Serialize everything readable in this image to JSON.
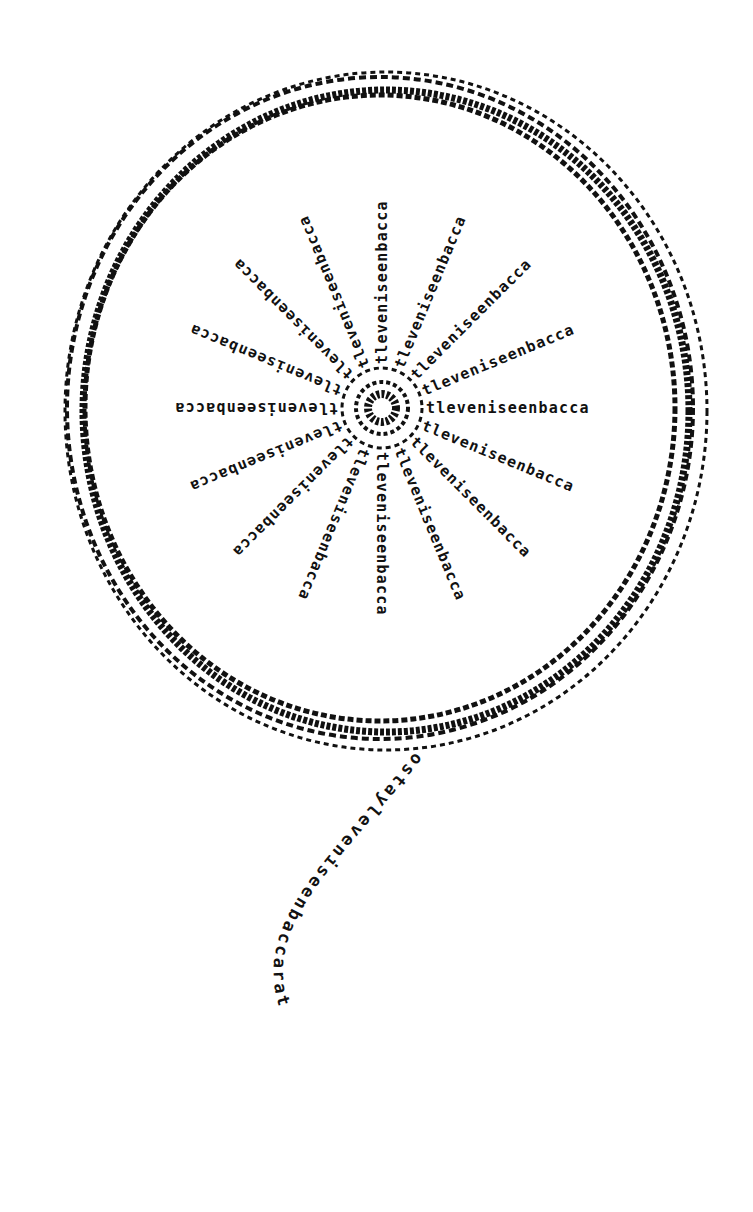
{
  "poem": {
    "spoke_text": "leveniseenbacca",
    "spoke_prefix": "t",
    "spoke_count": 16,
    "tail_text": "ostayleveniseenbaccarat",
    "colors": {
      "ink": "#111111",
      "paper": "#ffffff"
    },
    "wheel": {
      "cx": 382,
      "cy": 408,
      "rx": 315,
      "ry": 333
    }
  }
}
